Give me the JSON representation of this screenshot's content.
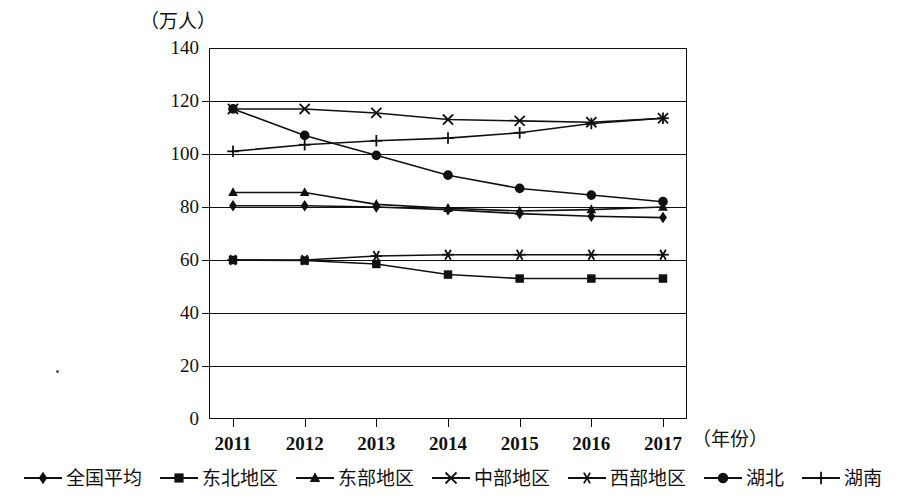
{
  "axis": {
    "unit_label": "（万人）",
    "x_title": "（年份）",
    "y_ticks": [
      "140",
      "120",
      "100",
      "80",
      "60",
      "40",
      "20",
      "0"
    ],
    "x_ticks": [
      "2011",
      "2012",
      "2013",
      "2014",
      "2015",
      "2016",
      "2017"
    ]
  },
  "legend": {
    "items": [
      {
        "label": "全国平均",
        "marker": "diamond-marker"
      },
      {
        "label": "东北地区",
        "marker": "square-marker"
      },
      {
        "label": "东部地区",
        "marker": "triangle-marker"
      },
      {
        "label": "中部地区",
        "marker": "cross-x-marker"
      },
      {
        "label": "西部地区",
        "marker": "asterisk-marker"
      },
      {
        "label": "湖北",
        "marker": "circle-marker"
      },
      {
        "label": "湖南",
        "marker": "plus-marker"
      }
    ]
  },
  "chart_data": {
    "type": "line",
    "title": "",
    "xlabel": "（年份）",
    "ylabel": "（万人）",
    "x": [
      "2011",
      "2012",
      "2013",
      "2014",
      "2015",
      "2016",
      "2017"
    ],
    "ylim": [
      0,
      140
    ],
    "ytick_step": 20,
    "grid": true,
    "legend_position": "bottom",
    "series": [
      {
        "name": "全国平均",
        "marker": "diamond",
        "values": [
          80.5,
          80.5,
          80.0,
          79.0,
          77.5,
          76.5,
          76.0
        ]
      },
      {
        "name": "东北地区",
        "marker": "square",
        "values": [
          60.0,
          59.8,
          58.5,
          54.5,
          53.0,
          53.0,
          53.0
        ]
      },
      {
        "name": "东部地区",
        "marker": "triangle",
        "values": [
          85.5,
          85.5,
          81.0,
          79.5,
          78.5,
          79.0,
          80.0
        ]
      },
      {
        "name": "中部地区",
        "marker": "cross-x",
        "values": [
          117.0,
          117.0,
          115.5,
          113.0,
          112.5,
          112.0,
          113.5
        ]
      },
      {
        "name": "西部地区",
        "marker": "asterisk",
        "values": [
          60.0,
          60.0,
          61.5,
          62.0,
          62.0,
          62.0,
          62.0
        ]
      },
      {
        "name": "湖北",
        "marker": "circle",
        "values": [
          117.0,
          107.0,
          99.5,
          92.0,
          87.0,
          84.5,
          82.0
        ]
      },
      {
        "name": "湖南",
        "marker": "plus",
        "values": [
          101.0,
          103.5,
          105.0,
          106.0,
          108.0,
          111.5,
          113.5
        ]
      }
    ]
  }
}
